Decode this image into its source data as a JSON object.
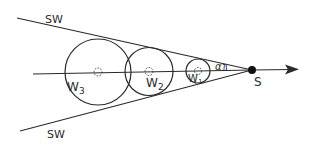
{
  "diagram": {
    "labels": {
      "sw_top": "SW",
      "sw_bottom": "SW",
      "w3_main": "W",
      "w3_sub": "3",
      "w2_main": "W",
      "w2_sub": "2",
      "w1_main": "W",
      "w1_sub": "1",
      "alpha": "α",
      "alpha_sub": "1",
      "apex": "S"
    },
    "colors": {
      "stroke": "#2a2a2a",
      "background": "#ffffff"
    }
  }
}
